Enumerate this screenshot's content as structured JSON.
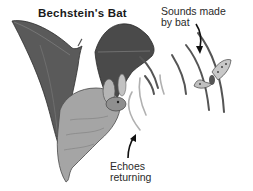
{
  "diagram": {
    "title": "Bechstein's Bat",
    "labels": {
      "sounds_line1": "Sounds made",
      "sounds_line2": "by bat",
      "echoes_line1": "Echoes",
      "echoes_line2": "returning"
    },
    "elements": [
      "bat",
      "sound-waves",
      "echo-waves",
      "moth"
    ],
    "colors": {
      "wing": "#5a5a5a",
      "wing_dark": "#3a3a3a",
      "body": "#9a9a9a",
      "wave": "#555555",
      "echo": "#b0b0b0",
      "text": "#2a2a2a"
    }
  }
}
